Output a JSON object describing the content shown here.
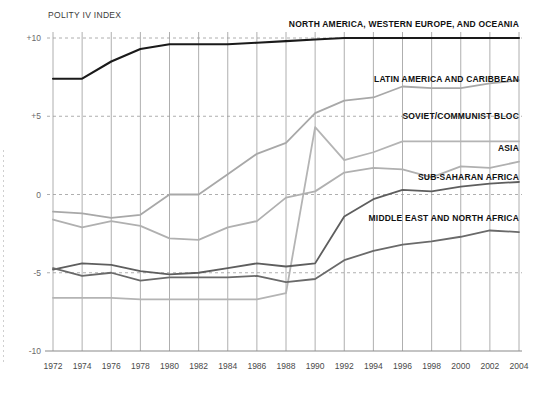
{
  "chart_data": {
    "type": "line",
    "title": "POLITY IV INDEX",
    "xlabel": "",
    "ylabel": "POLITY IV INDEX",
    "x": [
      1972,
      1974,
      1976,
      1978,
      1980,
      1982,
      1984,
      1986,
      1988,
      1990,
      1992,
      1994,
      1996,
      1998,
      2000,
      2002,
      2004
    ],
    "xlim": [
      1972,
      2004
    ],
    "ylim": [
      -10,
      10
    ],
    "yticks": [
      10,
      5,
      0,
      -5,
      -10
    ],
    "ytick_labels": [
      "+10",
      "+5",
      "0",
      "-5",
      "-10"
    ],
    "xtick_labels": [
      "1972",
      "1974",
      "1976",
      "1978",
      "1980",
      "1982",
      "1984",
      "1986",
      "1988",
      "1990",
      "1992",
      "1994",
      "1996",
      "1998",
      "2000",
      "2002",
      "2004"
    ],
    "grid": "vertical solid gray, horizontal dashed gray",
    "legend_position": "inline-right-of-series",
    "series": [
      {
        "name": "NORTH AMERICA, WESTERN EUROPE, AND OCEANIA",
        "color": "#1a1a1a",
        "width": 2.1,
        "label_x": 2004,
        "label_y": 10.9,
        "values": [
          7.4,
          7.4,
          8.5,
          9.3,
          9.6,
          9.6,
          9.6,
          9.7,
          9.8,
          9.9,
          10.0,
          10.0,
          10.0,
          10.0,
          10.0,
          10.0,
          10.0
        ]
      },
      {
        "name": "LATIN AMERICA AND CARIBBEAN",
        "color": "#a8a8a8",
        "width": 1.8,
        "label_x": 2004,
        "label_y": 7.4,
        "values": [
          -1.1,
          -1.2,
          -1.5,
          -1.3,
          0.0,
          0.0,
          1.3,
          2.6,
          3.3,
          5.2,
          6.0,
          6.2,
          6.9,
          6.8,
          6.8,
          7.1,
          7.3
        ]
      },
      {
        "name": "SOVIET/COMMUNIST BLOC",
        "color": "#b4b4b4",
        "width": 1.8,
        "label_x": 2004,
        "label_y": 5.0,
        "values": [
          -6.6,
          -6.6,
          -6.6,
          -6.7,
          -6.7,
          -6.7,
          -6.7,
          -6.7,
          -6.3,
          4.3,
          2.2,
          2.7,
          3.4,
          3.4,
          3.4,
          3.4,
          3.4
        ]
      },
      {
        "name": "ASIA",
        "color": "#b0b0b0",
        "width": 1.8,
        "label_x": 2004,
        "label_y": 3.0,
        "values": [
          -1.6,
          -2.1,
          -1.7,
          -2.0,
          -2.8,
          -2.9,
          -2.1,
          -1.7,
          -0.2,
          0.2,
          1.4,
          1.7,
          1.6,
          1.1,
          1.8,
          1.7,
          2.1
        ]
      },
      {
        "name": "SUB-SAHARAN AFRICA",
        "color": "#5e5e5e",
        "width": 1.8,
        "label_x": 2004,
        "label_y": 1.1,
        "values": [
          -4.8,
          -4.4,
          -4.5,
          -4.9,
          -5.1,
          -5.0,
          -4.7,
          -4.4,
          -4.6,
          -4.4,
          -1.4,
          -0.3,
          0.3,
          0.2,
          0.5,
          0.7,
          0.8
        ]
      },
      {
        "name": "MIDDLE EAST AND NORTH AFRICA",
        "color": "#6a6a6a",
        "width": 1.8,
        "label_x": 2004,
        "label_y": -1.5,
        "values": [
          -4.7,
          -5.2,
          -5.0,
          -5.5,
          -5.3,
          -5.3,
          -5.3,
          -5.2,
          -5.6,
          -5.4,
          -4.2,
          -3.6,
          -3.2,
          -3.0,
          -2.7,
          -2.3,
          -2.4
        ]
      }
    ]
  },
  "colors": {
    "axis": "#8a8a8a",
    "grid_vertical": "#9a9a9a",
    "grid_horizontal": "#9a9a9a",
    "text": "#1a1a1a"
  }
}
